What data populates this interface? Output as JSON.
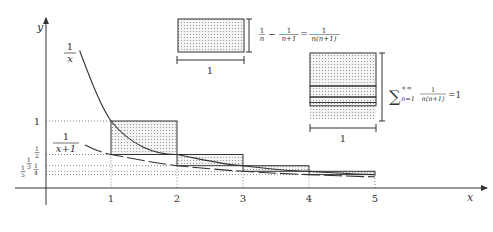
{
  "diagram": {
    "axes": {
      "x_label": "x",
      "y_label": "y",
      "x_ticks": [
        "1",
        "2",
        "3",
        "4",
        "5"
      ],
      "y_ticks": [
        {
          "num": "1",
          "den": "",
          "label": "1"
        },
        {
          "num": "1",
          "den": "2",
          "label": "1/2"
        },
        {
          "num": "1",
          "den": "3",
          "label": "1/3"
        },
        {
          "num": "1",
          "den": "4",
          "label": "1/4"
        },
        {
          "num": "1",
          "den": "5",
          "label": "1/5"
        }
      ]
    },
    "curves": [
      {
        "name": "1/x",
        "num": "1",
        "den": "x"
      },
      {
        "name": "1/(x+1)",
        "num": "1",
        "den": "x+1"
      }
    ],
    "rectangles": [
      {
        "n": 1,
        "x0": 1,
        "x1": 2,
        "top": 1,
        "bottom": 0.5
      },
      {
        "n": 2,
        "x0": 2,
        "x1": 3,
        "top": 0.5,
        "bottom": 0.3333
      },
      {
        "n": 3,
        "x0": 3,
        "x1": 4,
        "top": 0.3333,
        "bottom": 0.25
      },
      {
        "n": 4,
        "x0": 4,
        "x1": 5,
        "top": 0.25,
        "bottom": 0.2
      }
    ],
    "inset_single": {
      "width_label": "1",
      "formula_left_1_num": "1",
      "formula_left_1_den": "n",
      "minus": "−",
      "formula_left_2_num": "1",
      "formula_left_2_den": "n+1",
      "equals": "=",
      "formula_right_num": "1",
      "formula_right_den": "n(n+1)"
    },
    "inset_stack": {
      "width_label": "1",
      "sum_symbol": "∑",
      "sum_upper": "+∞",
      "sum_lower": "n=1",
      "term_num": "1",
      "term_den": "n(n+1)",
      "result": "=1"
    },
    "colors": {
      "stroke": "#333333",
      "grid_dotted": "#555555",
      "fill_dots": "#888888",
      "background": "#ffffff"
    }
  }
}
